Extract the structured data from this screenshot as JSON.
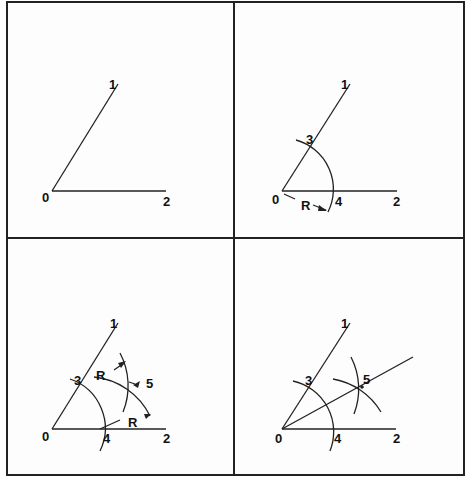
{
  "figure": {
    "colors": {
      "line": "#222222",
      "background": "#fdfdfd",
      "border": "#222222"
    },
    "panels": [
      {
        "step": 1,
        "labels": {
          "vertex": "0",
          "ray1_end": "1",
          "ray2_end": "2"
        }
      },
      {
        "step": 2,
        "labels": {
          "vertex": "0",
          "ray1_end": "1",
          "ray2_end": "2",
          "arc_point_ray1": "3",
          "arc_point_ray2": "4",
          "radius": "R"
        }
      },
      {
        "step": 3,
        "labels": {
          "vertex": "0",
          "ray1_end": "1",
          "ray2_end": "2",
          "arc_point_ray1": "3",
          "arc_point_ray2": "4",
          "intersection": "5",
          "radius_a": "R",
          "radius_b": "R"
        }
      },
      {
        "step": 4,
        "labels": {
          "vertex": "0",
          "ray1_end": "1",
          "ray2_end": "2",
          "arc_point_ray1": "3",
          "arc_point_ray2": "4",
          "intersection": "5"
        }
      }
    ]
  }
}
